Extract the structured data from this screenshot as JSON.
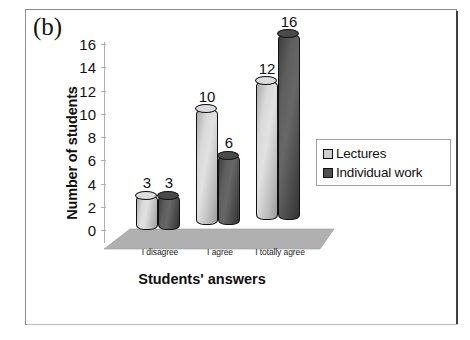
{
  "figure": {
    "panel_label": "(b)"
  },
  "chart_data": {
    "type": "bar",
    "title": "",
    "subtitle": "",
    "xlabel": "Students' answers",
    "ylabel": "Number of students",
    "categories": [
      "I disagree",
      "I agree",
      "I totally agree"
    ],
    "series": [
      {
        "name": "Lectures",
        "values": [
          3,
          10,
          12
        ],
        "color": "#cfcfcf"
      },
      {
        "name": "Individual work",
        "values": [
          3,
          6,
          16
        ],
        "color": "#4f4f4f"
      }
    ],
    "ylim": [
      0,
      16
    ],
    "ytick_step": 2,
    "ytick_labels": [
      "0",
      "2",
      "4",
      "6",
      "8",
      "10",
      "12",
      "14",
      "16"
    ],
    "data_labels": [
      "3",
      "3",
      "10",
      "6",
      "12",
      "16"
    ],
    "grid": false,
    "legend_position": "right",
    "style_3d": true
  },
  "legend": {
    "entries": [
      {
        "label": "Lectures",
        "swatch": "light"
      },
      {
        "label": "Individual work",
        "swatch": "dark"
      }
    ]
  }
}
